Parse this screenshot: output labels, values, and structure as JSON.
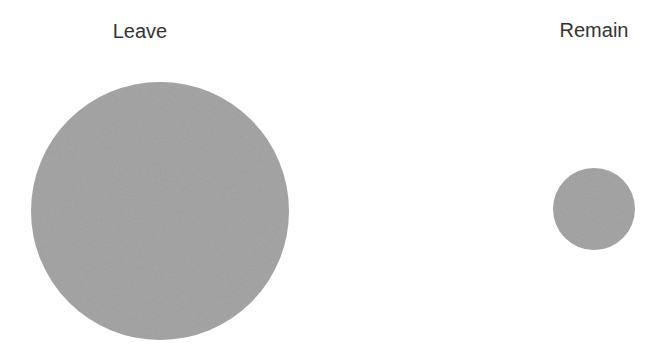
{
  "chart_data": {
    "type": "bubble",
    "title": "",
    "categories": [
      "Leave",
      "Remain"
    ],
    "values": [
      100,
      10
    ],
    "value_encoding": "circle area (relative)",
    "circles": [
      {
        "label": "Leave",
        "cx": 160,
        "cy": 211,
        "r": 129
      },
      {
        "label": "Remain",
        "cx": 594,
        "cy": 209,
        "r": 41
      }
    ],
    "fill_color": "#a9a9a9",
    "xlabel": "",
    "ylabel": "",
    "legend": "none",
    "grid": false
  },
  "labels": {
    "leave": "Leave",
    "remain": "Remain"
  }
}
